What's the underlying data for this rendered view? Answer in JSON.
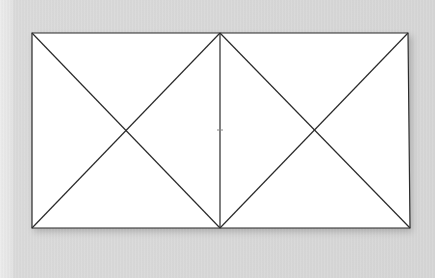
{
  "diagram": {
    "type": "rectangle-with-diagonals",
    "colors": {
      "background": "#d9d9d9",
      "paper": "#ffffff",
      "line": "#2b2b2b"
    },
    "rectangle": {
      "x1": 32,
      "y1": 33,
      "x2": 409,
      "y2": 228
    },
    "divider_x": 220,
    "center_tick": {
      "x": 220,
      "y": 130
    },
    "panels": [
      {
        "name": "left-square",
        "x1": 32,
        "x2": 220
      },
      {
        "name": "right-square",
        "x1": 220,
        "x2": 409
      }
    ]
  }
}
